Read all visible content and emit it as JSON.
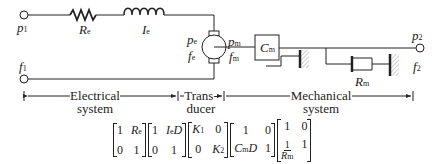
{
  "diagram": {
    "terminals": {
      "p1": {
        "sym": "p",
        "sub": "1"
      },
      "f1": {
        "sym": "f",
        "sub": "1"
      },
      "p2": {
        "sym": "p",
        "sub": "2"
      },
      "f2": {
        "sym": "f",
        "sub": "2"
      }
    },
    "components": {
      "resistor": {
        "sym": "R",
        "sub": "e"
      },
      "inductor": {
        "sym": "I",
        "sub": "e"
      },
      "motor_pe": {
        "sym": "p",
        "sub": "e"
      },
      "motor_fe": {
        "sym": "f",
        "sub": "e"
      },
      "motor_pm": {
        "sym": "p",
        "sub": "m"
      },
      "motor_fm": {
        "sym": "f",
        "sub": "m"
      },
      "compliance": {
        "sym": "C",
        "sub": "m"
      },
      "damper": {
        "sym": "R",
        "sub": "m"
      }
    },
    "sections": [
      {
        "line1": "Electrical",
        "line2": "system"
      },
      {
        "line1": "Trans-",
        "line2": "ducer"
      },
      {
        "line1": "Mechanical",
        "line2": "system"
      }
    ]
  },
  "matrices": [
    {
      "a": "1",
      "b": "R",
      "b_sub": "e",
      "c": "0",
      "d": "1"
    },
    {
      "a": "1",
      "b": "I",
      "b_sub": "e",
      "b_tail": "D",
      "c": "0",
      "d": "1"
    },
    {
      "a": "K",
      "a_sub": "1",
      "b": "0",
      "c": "0",
      "d": "K",
      "d_sub": "2"
    },
    {
      "a": "1",
      "b": "0",
      "c": "C",
      "c_sub": "m",
      "c_tail": "D",
      "d": "1"
    },
    {
      "a": "1",
      "b": "0",
      "c_num": "1",
      "c_den": "R",
      "c_den_sub": "m",
      "d": "1"
    }
  ]
}
